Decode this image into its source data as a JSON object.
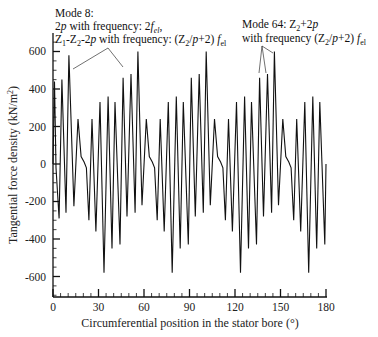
{
  "chart_data": {
    "type": "line",
    "title": "",
    "xlabel": "Circumferential position in the stator bore (°)",
    "ylabel": "Tangential force density (kN/m²)",
    "ylabel_parts": {
      "main": "Tangential force density (kN/m",
      "sup": "2",
      "end": ")"
    },
    "xlim": [
      0,
      180
    ],
    "ylim": [
      -700,
      720
    ],
    "x_ticks": [
      0,
      30,
      60,
      90,
      120,
      150,
      180
    ],
    "x_minor_step": 5,
    "y_ticks": [
      -600,
      -400,
      -200,
      0,
      200,
      400,
      600
    ],
    "y_minor_step": 50,
    "grid": false,
    "legend": null,
    "period_deg": 45,
    "series": [
      {
        "name": "Tangential force density",
        "color": "#111111",
        "x": [
          0,
          1.0,
          2.0,
          4.0,
          5.9,
          8.6,
          10.5,
          13.8,
          16.5,
          18.5,
          20.5,
          22.0,
          23.7,
          25.7,
          28.3,
          31.0,
          33.6,
          36.3,
          38.9,
          40.9,
          44.2,
          46.2,
          48.8,
          51.4,
          54.1,
          56.0,
          58.7,
          61.5,
          63.5,
          65.5,
          67.0,
          68.7,
          70.7,
          73.3,
          76.0,
          78.6,
          81.3,
          83.9,
          85.9,
          89.2,
          91.2,
          93.8,
          96.4,
          99.1,
          101.0,
          103.7,
          106.5,
          108.5,
          110.5,
          112.0,
          113.7,
          115.7,
          118.3,
          121.0,
          123.6,
          126.3,
          128.9,
          130.9,
          134.2,
          136.2,
          138.8,
          141.4,
          144.1,
          146.0,
          148.7,
          151.5,
          153.5,
          155.5,
          157.0,
          158.7,
          160.7,
          163.3,
          166.0,
          168.6,
          171.3,
          173.9,
          175.9,
          179.2,
          180
        ],
        "y": [
          0,
          440,
          -20,
          -290,
          450,
          -260,
          580,
          -225,
          240,
          40,
          10,
          -20,
          -300,
          240,
          -360,
          330,
          -580,
          360,
          -450,
          330,
          -430,
          460,
          -280,
          480,
          -260,
          600,
          -220,
          240,
          40,
          10,
          -20,
          -300,
          240,
          -360,
          330,
          -580,
          360,
          -450,
          330,
          -430,
          460,
          -280,
          480,
          -260,
          600,
          -220,
          240,
          40,
          10,
          -20,
          -300,
          240,
          -360,
          330,
          -580,
          360,
          -450,
          330,
          -430,
          460,
          -280,
          480,
          -260,
          600,
          -220,
          240,
          40,
          10,
          -20,
          -300,
          240,
          -360,
          330,
          -580,
          360,
          -450,
          330,
          -430,
          0
        ]
      }
    ],
    "annotations": [
      {
        "text_lines": [
          "Mode 8:",
          "2p with frequency: 2f_el,",
          "Z1-Z2-2p with frequency: (Z2/p+2) f_el"
        ],
        "arrow_targets_deg": [
          [
            10.5,
            580
          ],
          [
            46.2,
            460
          ]
        ]
      },
      {
        "text_lines": [
          "Mode 64: Z2+2p",
          "with frequency (Z2/p+2) f_el"
        ],
        "arrow_targets_deg": [
          [
            136.2,
            460
          ],
          [
            141.4,
            480
          ],
          [
            146.0,
            600
          ]
        ]
      }
    ]
  },
  "annotations": {
    "mode8": {
      "line1": "Mode 8:",
      "line2_a": "2",
      "line2_b": "p",
      "line2_c": " with frequency: 2",
      "line2_d": "f",
      "line2_e": "el",
      "line2_f": ",",
      "line3_a": "Z",
      "line3_b": "1",
      "line3_c": "-Z",
      "line3_d": "2",
      "line3_e": "-2",
      "line3_f": "p",
      "line3_g": " with frequency: (Z",
      "line3_h": "2",
      "line3_i": "/",
      "line3_j": "p",
      "line3_k": "+2) ",
      "line3_l": "f",
      "line3_m": "el"
    },
    "mode64": {
      "line1_a": "Mode 64: Z",
      "line1_b": "2",
      "line1_c": "+2",
      "line1_d": "p",
      "line2_a": "with frequency (Z",
      "line2_b": "2",
      "line2_c": "/",
      "line2_d": "p",
      "line2_e": "+2) ",
      "line2_f": "f",
      "line2_g": "el"
    }
  },
  "axes": {
    "x_tick_labels": [
      "0",
      "30",
      "60",
      "90",
      "120",
      "150",
      "180"
    ],
    "y_tick_labels": [
      "-600",
      "-400",
      "-200",
      "0",
      "200",
      "400",
      "600"
    ]
  }
}
